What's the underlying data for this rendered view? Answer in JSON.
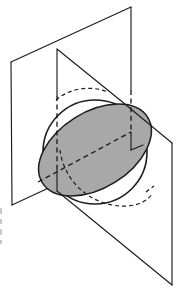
{
  "figure": {
    "name": "sphere-cut-by-two-planes",
    "background_color": "#ffffff",
    "line_color": "#1c1c1c",
    "shaded_fill_color": "#a8a8a8",
    "canvas": {
      "width": 184,
      "height": 292
    }
  },
  "elements": {
    "sphere": {
      "name": "sphere-outline",
      "style": "solid",
      "center": {
        "x": 95,
        "y": 152
      },
      "radius": 52
    },
    "ellipse_section": {
      "name": "elliptical-cross-section",
      "style": "solid-filled",
      "fill": "#a8a8a8",
      "center": {
        "x": 95,
        "y": 150
      },
      "semi_major": 62,
      "semi_minor": 38,
      "rotation_deg": -32
    },
    "plane_front": {
      "name": "front-vertical-plane",
      "style": "solid",
      "corners": [
        {
          "x": 11,
          "y": 62
        },
        {
          "x": 131,
          "y": 7
        },
        {
          "x": 131,
          "y": 150
        },
        {
          "x": 12,
          "y": 205
        }
      ]
    },
    "plane_oblique": {
      "name": "oblique-cutting-plane",
      "style": "solid",
      "corners": [
        {
          "x": 57,
          "y": 49
        },
        {
          "x": 172,
          "y": 143
        },
        {
          "x": 172,
          "y": 285
        },
        {
          "x": 57,
          "y": 191
        }
      ]
    },
    "hidden_edges": {
      "name": "hidden-construction-lines",
      "style": "dashed",
      "segments": [
        {
          "from": {
            "x": 57,
            "y": 96
          },
          "to": {
            "x": 57,
            "y": 170
          }
        },
        {
          "from": {
            "x": 131,
            "y": 90
          },
          "to": {
            "x": 131,
            "y": 132
          }
        },
        {
          "from": {
            "x": 68,
            "y": 166
          },
          "to": {
            "x": 131,
            "y": 132
          }
        },
        {
          "from": {
            "x": 38,
            "y": 182
          },
          "to": {
            "x": 68,
            "y": 166
          }
        }
      ]
    },
    "hidden_ellipse_arc": {
      "name": "hidden-ellipse-back-arc",
      "style": "dashed"
    }
  }
}
